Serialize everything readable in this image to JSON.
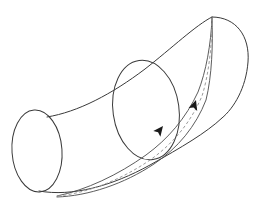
{
  "figure": {
    "title": "Curved tube with geodesic path",
    "canvas": {
      "width": 277,
      "height": 207,
      "background": "#ffffff"
    },
    "colors": {
      "outline": "#3a3a3a",
      "band_edge": "#4a4a4a",
      "band_center_dashed": "#9a9a9a",
      "arrow_fill": "#1a1a1a",
      "surface_fill": "#ffffff"
    },
    "elements": {
      "left_end_cap": {
        "name": "left elliptical end cap",
        "center_x": 37,
        "center_y": 151,
        "radius_x": 25,
        "radius_y": 41,
        "rotation_deg": -4
      },
      "middle_cross_section": {
        "name": "middle elliptical cross-section",
        "center_x": 146,
        "center_y": 110,
        "radius_x": 33,
        "radius_y": 50,
        "rotation_deg": -8
      },
      "right_end_cap": {
        "name": "rounded right end cap",
        "apex_x": 212,
        "apex_y": 17,
        "bottom_x": 222,
        "bottom_y": 118
      },
      "top_outline": {
        "name": "upper silhouette of tube",
        "start_x": 47,
        "start_y": 117,
        "end_x": 212,
        "end_y": 17
      },
      "bottom_outline": {
        "name": "lower silhouette of tube",
        "start_x": 40,
        "start_y": 192,
        "end_x": 222,
        "end_y": 118
      },
      "geodesic_band": {
        "name": "geodesic band on tube surface",
        "start_x": 57,
        "start_y": 196,
        "converge_x": 212,
        "converge_y": 18,
        "edge_count": 2,
        "centerline_style": "dashed"
      },
      "arrows": [
        {
          "name": "lower direction arrowhead",
          "x": 163,
          "y": 126,
          "angle_deg": -52,
          "size": 9
        },
        {
          "name": "upper direction arrowhead",
          "x": 196,
          "y": 100,
          "angle_deg": -72,
          "size": 9
        }
      ]
    },
    "labels": []
  }
}
